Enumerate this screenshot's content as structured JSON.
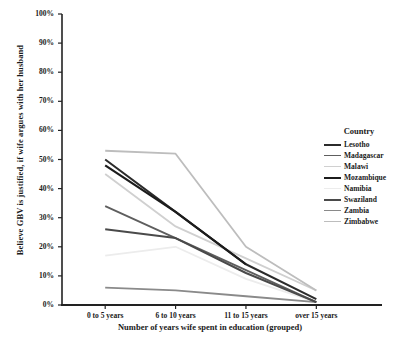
{
  "chart_data": {
    "type": "line",
    "title": "",
    "xlabel": "Number of years wife spent in education (grouped)",
    "ylabel": "Believe GBV is justified, if wife argues with her husband",
    "categories": [
      "0 to 5 years",
      "6 to 10 years",
      "11 to 15 years",
      "over 15 years"
    ],
    "ylim": [
      0,
      100
    ],
    "ytick_labels": [
      "100%",
      "90%",
      "80%",
      "70%",
      "60%",
      "50%",
      "40%",
      "30%",
      "20%",
      "10%",
      "0%"
    ],
    "ytick_values": [
      100,
      90,
      80,
      70,
      60,
      50,
      40,
      30,
      20,
      10,
      0
    ],
    "grid": false,
    "legend_position": "right",
    "legend_title": "Country",
    "series": [
      {
        "name": "Lesotho",
        "values": [
          50,
          32,
          14,
          2
        ],
        "color": "#2b2b2b",
        "width": 2.0
      },
      {
        "name": "Madagascar",
        "values": [
          34,
          23,
          12,
          1
        ],
        "color": "#5e5e5e",
        "width": 1.8
      },
      {
        "name": "Malawi",
        "values": [
          45,
          27,
          16,
          5
        ],
        "color": "#d0d0d0",
        "width": 1.8
      },
      {
        "name": "Mozambique",
        "values": [
          48,
          32,
          14,
          null
        ],
        "color": "#1c1c1c",
        "width": 2.2
      },
      {
        "name": "Namibia",
        "values": [
          17,
          20,
          9,
          1
        ],
        "color": "#ececec",
        "width": 1.8
      },
      {
        "name": "Swaziland",
        "values": [
          26,
          23,
          11,
          1
        ],
        "color": "#4a4a4a",
        "width": 2.0
      },
      {
        "name": "Zambia",
        "values": [
          6,
          5,
          3,
          1
        ],
        "color": "#8a8a8a",
        "width": 1.8
      },
      {
        "name": "Zimbabwe",
        "values": [
          53,
          52,
          20,
          5
        ],
        "color": "#bdbdbd",
        "width": 1.8
      }
    ]
  },
  "axes": {
    "plot_left": 62,
    "plot_right": 368,
    "plot_top": 14,
    "plot_bottom": 305
  }
}
